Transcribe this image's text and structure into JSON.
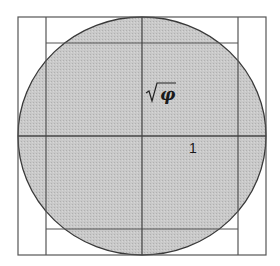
{
  "diagram": {
    "labels": {
      "sqrt_phi": "φ",
      "one": "1"
    },
    "colors": {
      "circle_fill": "#c4c4c4",
      "line": "#4a4a4a",
      "background": "#ffffff"
    },
    "geometry": {
      "outer_square": {
        "x1": 18,
        "y1": 17,
        "x2": 266,
        "y2": 255
      },
      "inner_vertical_lines_x": [
        46,
        238
      ],
      "inner_horizontal_lines_y": [
        43,
        229
      ],
      "center_vertical_x": 142,
      "center_horizontal_y": 136,
      "circle": {
        "cx": 142,
        "cy": 136,
        "rx": 124,
        "ry": 119
      }
    }
  }
}
